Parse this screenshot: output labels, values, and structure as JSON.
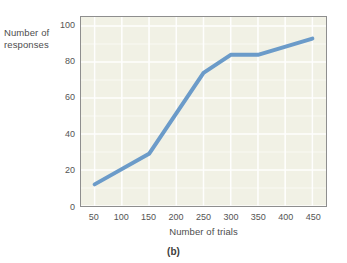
{
  "figure": {
    "caption": "(b)",
    "background_color": "#ffffff"
  },
  "chart_data": {
    "type": "line",
    "title": "",
    "subtitle": "",
    "xlabel": "Number of trials",
    "ylabel": "Number of responses",
    "ylabel_lines": [
      "Number of",
      "responses"
    ],
    "x": [
      50,
      150,
      250,
      300,
      350,
      450
    ],
    "values": [
      12,
      29,
      74,
      84,
      84,
      93
    ],
    "series": [
      {
        "name": "responses",
        "color": "#6b9bc9",
        "x": [
          50,
          150,
          250,
          300,
          350,
          450
        ],
        "values": [
          12,
          29,
          74,
          84,
          84,
          93
        ]
      }
    ],
    "xlim": [
      25,
      475
    ],
    "ylim": [
      0,
      105
    ],
    "xticks": [
      50,
      100,
      150,
      200,
      250,
      300,
      350,
      400,
      450
    ],
    "xtick_labels": [
      "50",
      "100",
      "150",
      "200",
      "250",
      "300",
      "350",
      "400",
      "450"
    ],
    "yticks": [
      0,
      20,
      40,
      60,
      80,
      100
    ],
    "ytick_labels": [
      "0",
      "20",
      "40",
      "60",
      "80",
      "100"
    ],
    "grid": true,
    "grid_color": "#ffffff",
    "plot_background": "#f1f1e5",
    "frame_color": "#8e8e8e",
    "legend": "none",
    "line_width": 4,
    "annotations": []
  }
}
